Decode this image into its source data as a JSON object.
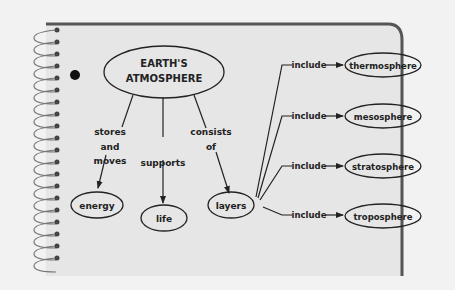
{
  "diagram": {
    "central_node": {
      "line1": "EARTH'S",
      "line2": "ATMOSPHERE"
    },
    "links": {
      "stores_and_moves": {
        "line1": "stores",
        "line2": "and",
        "line3": "moves"
      },
      "supports": "supports",
      "consists_of": {
        "line1": "consists",
        "line2": "of"
      },
      "include": "include"
    },
    "nodes": {
      "energy": "energy",
      "life": "life",
      "layers": "layers",
      "thermosphere": "thermosphere",
      "mesosphere": "mesosphere",
      "stratosphere": "stratosphere",
      "troposphere": "troposphere"
    },
    "colors": {
      "paper": "#e6e6e6",
      "background": "#f2f2f2",
      "line": "#222222",
      "border": "#555555"
    }
  }
}
